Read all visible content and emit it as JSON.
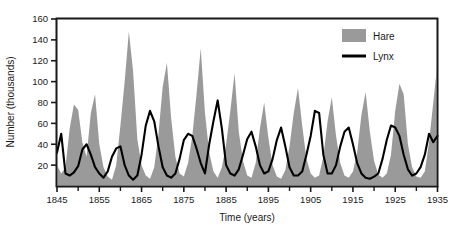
{
  "chart_data": {
    "type": "area",
    "title": "",
    "xlabel": "Time (years)",
    "ylabel": "Number (thousands)",
    "xlim": [
      1845,
      1935
    ],
    "ylim": [
      0,
      160
    ],
    "grid": false,
    "legend_position": "top-right",
    "x_tick_labels": [
      "1845",
      "1855",
      "1865",
      "1875",
      "1885",
      "1895",
      "1905",
      "1915",
      "1925",
      "1935"
    ],
    "x_tick_values": [
      1845,
      1855,
      1865,
      1875,
      1885,
      1895,
      1905,
      1915,
      1925,
      1935
    ],
    "x_minor_tick_values": [
      1850,
      1860,
      1870,
      1880,
      1890,
      1900,
      1910,
      1920,
      1930
    ],
    "y_tick_labels": [
      "20",
      "40",
      "60",
      "80",
      "100",
      "120",
      "140",
      "160"
    ],
    "y_tick_values": [
      20,
      40,
      60,
      80,
      100,
      120,
      140,
      160
    ],
    "x": [
      1845,
      1846,
      1847,
      1848,
      1849,
      1850,
      1851,
      1852,
      1853,
      1854,
      1855,
      1856,
      1857,
      1858,
      1859,
      1860,
      1861,
      1862,
      1863,
      1864,
      1865,
      1866,
      1867,
      1868,
      1869,
      1870,
      1871,
      1872,
      1873,
      1874,
      1875,
      1876,
      1877,
      1878,
      1879,
      1880,
      1881,
      1882,
      1883,
      1884,
      1885,
      1886,
      1887,
      1888,
      1889,
      1890,
      1891,
      1892,
      1893,
      1894,
      1895,
      1896,
      1897,
      1898,
      1899,
      1900,
      1901,
      1902,
      1903,
      1904,
      1905,
      1906,
      1907,
      1908,
      1909,
      1910,
      1911,
      1912,
      1913,
      1914,
      1915,
      1916,
      1917,
      1918,
      1919,
      1920,
      1921,
      1922,
      1923,
      1924,
      1925,
      1926,
      1927,
      1928,
      1929,
      1930,
      1931,
      1932,
      1933,
      1934,
      1935
    ],
    "series": [
      {
        "name": "Hare",
        "kind": "area",
        "color": "#9a9a9a",
        "unit": "thousands",
        "values": [
          20,
          12,
          18,
          55,
          78,
          73,
          42,
          28,
          70,
          88,
          40,
          18,
          9,
          6,
          20,
          58,
          100,
          148,
          110,
          45,
          20,
          10,
          7,
          18,
          50,
          95,
          118,
          65,
          28,
          12,
          9,
          22,
          48,
          88,
          132,
          70,
          32,
          14,
          8,
          18,
          40,
          72,
          108,
          52,
          24,
          10,
          8,
          22,
          55,
          80,
          46,
          20,
          9,
          7,
          15,
          38,
          70,
          94,
          58,
          26,
          12,
          8,
          10,
          28,
          62,
          85,
          48,
          22,
          10,
          8,
          14,
          32,
          68,
          90,
          52,
          24,
          11,
          8,
          12,
          30,
          72,
          98,
          88,
          40,
          18,
          9,
          8,
          14,
          42,
          80,
          118
        ]
      },
      {
        "name": "Lynx",
        "kind": "line",
        "color": "#000000",
        "unit": "thousands",
        "values": [
          32,
          50,
          12,
          10,
          13,
          19,
          35,
          40,
          30,
          18,
          12,
          8,
          14,
          28,
          36,
          38,
          20,
          10,
          6,
          10,
          30,
          58,
          72,
          62,
          38,
          18,
          10,
          8,
          12,
          26,
          44,
          50,
          48,
          36,
          22,
          12,
          40,
          62,
          82,
          55,
          20,
          12,
          10,
          16,
          30,
          45,
          52,
          38,
          20,
          12,
          14,
          26,
          44,
          56,
          38,
          18,
          10,
          10,
          14,
          30,
          48,
          72,
          70,
          30,
          12,
          12,
          20,
          38,
          52,
          56,
          40,
          22,
          12,
          8,
          7,
          9,
          12,
          26,
          44,
          58,
          56,
          48,
          30,
          16,
          10,
          12,
          18,
          30,
          50,
          42,
          48
        ]
      }
    ],
    "legend": [
      {
        "label": "Hare",
        "marker": "filled-square",
        "color": "#9a9a9a"
      },
      {
        "label": "Lynx",
        "marker": "line",
        "color": "#000000"
      }
    ]
  },
  "axes": {
    "y_axis_title": "Number (thousands)",
    "x_axis_title": "Time (years)"
  }
}
